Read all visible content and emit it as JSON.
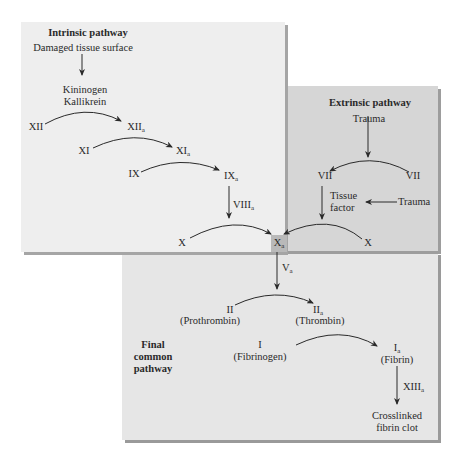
{
  "diagram": {
    "type": "coagulation-cascade",
    "colors": {
      "intrinsic_bg": "#eeeeee",
      "extrinsic_bg": "#d6d6d6",
      "final_bg": "#e6e6e6",
      "xa_highlight": "#b9b9b9",
      "text": "#2a2a2a"
    }
  },
  "intrinsic": {
    "title": "Intrinsic pathway",
    "trigger": "Damaged tissue surface",
    "cofactor_line1": "Kininogen",
    "cofactor_line2": "Kallikrein",
    "nodes": {
      "xii": "XII",
      "xiia": "XII",
      "xi": "XI",
      "xia": "XI",
      "ix": "IX",
      "ixa": "IX",
      "viiia": "VIII",
      "x": "X"
    },
    "subscript": "a"
  },
  "extrinsic": {
    "title": "Extrinsic pathway",
    "trigger": "Trauma",
    "vii": "VII",
    "viia": "VII",
    "tissue_factor_line1": "Tissue",
    "tissue_factor_line2": "factor",
    "trauma2": "Trauma",
    "x": "X"
  },
  "center": {
    "xa": "X",
    "subscript": "a"
  },
  "final": {
    "title_line1": "Final",
    "title_line2": "common",
    "title_line3": "pathway",
    "va": "V",
    "ii": "II",
    "prothrombin": "(Prothrombin)",
    "iia": "II",
    "thrombin": "(Thrombin)",
    "i": "I",
    "fibrinogen": "(Fibrinogen)",
    "ia": "I",
    "fibrin": "(Fibrin)",
    "xiiia": "XIII",
    "clot_line1": "Crosslinked",
    "clot_line2": "fibrin clot"
  }
}
